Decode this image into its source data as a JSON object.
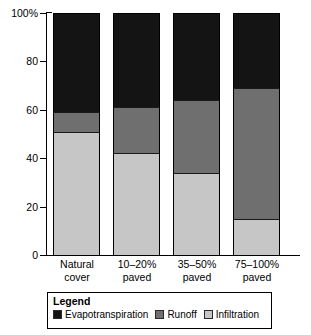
{
  "chart_data": {
    "type": "bar",
    "subtype": "stacked-bar-100",
    "title": "",
    "xlabel": "",
    "ylabel": "",
    "ylim": [
      0,
      100
    ],
    "yticks": [
      "0",
      "20",
      "40",
      "60",
      "80",
      "100%"
    ],
    "ytick_values": [
      0,
      20,
      40,
      60,
      80,
      100
    ],
    "grid": false,
    "legend_position": "bottom",
    "legend_title": "Legend",
    "categories": [
      "Natural cover",
      "10–20% paved",
      "35–50% paved",
      "75–100% paved"
    ],
    "category_lines": [
      {
        "line1": "Natural",
        "line2": "cover"
      },
      {
        "line1": "10–20%",
        "line2": "paved"
      },
      {
        "line1": "35–50%",
        "line2": "paved"
      },
      {
        "line1": "75–100%",
        "line2": "paved"
      }
    ],
    "series": [
      {
        "name": "Evapotranspiration",
        "color": "#141414",
        "values": [
          41,
          39,
          36,
          31
        ]
      },
      {
        "name": "Runoff",
        "color": "#6f6f6f",
        "values": [
          8,
          19,
          30,
          54
        ]
      },
      {
        "name": "Infiltration",
        "color": "#c6c6c6",
        "values": [
          51,
          42,
          34,
          15
        ]
      }
    ],
    "stack_order_bottom_to_top": [
      "Infiltration",
      "Runoff",
      "Evapotranspiration"
    ],
    "cumulative_tops": {
      "Infiltration": [
        51,
        42,
        34,
        15
      ],
      "Runoff": [
        59,
        61,
        64,
        69
      ],
      "Evapotranspiration": [
        100,
        100,
        100,
        100
      ]
    }
  },
  "axis": {
    "y_tick_labels": [
      "100%",
      "80",
      "60",
      "40",
      "20",
      "0"
    ]
  },
  "legend": {
    "title": "Legend",
    "items": [
      {
        "label": "Evapotranspiration",
        "swatch": "evap"
      },
      {
        "label": "Runoff",
        "swatch": "runoff"
      },
      {
        "label": "Infiltration",
        "swatch": "infil"
      }
    ]
  },
  "colors": {
    "evapotranspiration": "#141414",
    "runoff": "#6f6f6f",
    "infiltration": "#c6c6c6",
    "axis": "#000000",
    "background": "#ffffff"
  }
}
